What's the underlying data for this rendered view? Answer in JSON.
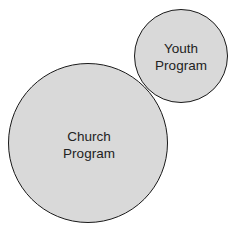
{
  "diagram": {
    "type": "tangent-circles",
    "background": "#ffffff",
    "fill_color": "#d9d9d9",
    "stroke_color": "#1a1a1a",
    "circles": [
      {
        "id": "church",
        "label_line1": "Church",
        "label_line2": "Program",
        "cx": 88,
        "cy": 143,
        "r": 80
      },
      {
        "id": "youth",
        "label_line1": "Youth",
        "label_line2": "Program",
        "cx": 181,
        "cy": 56,
        "r": 47
      }
    ]
  }
}
